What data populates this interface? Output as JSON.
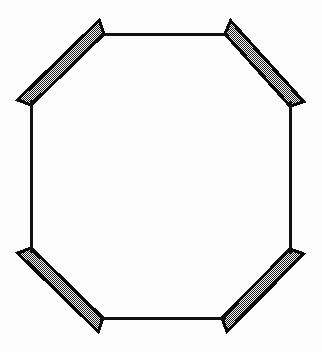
{
  "figure": {
    "canvas": {
      "width": 322,
      "height": 352
    },
    "colors": {
      "background": "#fdfdfd",
      "line": "#111111",
      "bar_outline": "#0d0d0d",
      "bar_fill_dark": "#1a1a1a",
      "bar_fill_light": "#ffffff",
      "bar_fill_apparent": "#8c8c8c"
    },
    "style": {
      "thin_stroke_width": 2.1,
      "bar_outline_width": 3.2,
      "bar_thickness": 13,
      "fill_pattern": "checkerboard-dither-50"
    }
  },
  "geometry": {
    "thin_edges": [
      {
        "name": "top-edge",
        "x1": 104,
        "y1": 34,
        "x2": 225,
        "y2": 34
      },
      {
        "name": "right-edge",
        "x1": 290,
        "y1": 106,
        "x2": 290,
        "y2": 249
      },
      {
        "name": "bottom-edge",
        "x1": 103,
        "y1": 318,
        "x2": 222,
        "y2": 318
      },
      {
        "name": "left-edge",
        "x1": 31,
        "y1": 105,
        "x2": 31,
        "y2": 248
      }
    ],
    "corner_bars": [
      {
        "name": "top-left-bar",
        "center_line": {
          "x1": 31,
          "y1": 105,
          "x2": 104,
          "y2": 34
        },
        "thickness": 13,
        "angle_deg": -44.2
      },
      {
        "name": "top-right-bar",
        "center_line": {
          "x1": 225,
          "y1": 34,
          "x2": 290,
          "y2": 106
        },
        "thickness": 13,
        "angle_deg": 47.9
      },
      {
        "name": "bottom-right-bar",
        "center_line": {
          "x1": 290,
          "y1": 249,
          "x2": 222,
          "y2": 318
        },
        "thickness": 13,
        "angle_deg": 134.6
      },
      {
        "name": "bottom-left-bar",
        "center_line": {
          "x1": 103,
          "y1": 318,
          "x2": 31,
          "y2": 248
        },
        "thickness": 13,
        "angle_deg": 224.2
      }
    ],
    "vertices": [
      {
        "name": "v-top-left",
        "x": 104,
        "y": 34
      },
      {
        "name": "v-top-right",
        "x": 225,
        "y": 34
      },
      {
        "name": "v-right-top",
        "x": 290,
        "y": 106
      },
      {
        "name": "v-right-bottom",
        "x": 290,
        "y": 249
      },
      {
        "name": "v-bottom-right",
        "x": 222,
        "y": 318
      },
      {
        "name": "v-bottom-left",
        "x": 103,
        "y": 318
      },
      {
        "name": "v-left-bottom",
        "x": 31,
        "y": 248
      },
      {
        "name": "v-left-top",
        "x": 31,
        "y": 105
      }
    ]
  }
}
